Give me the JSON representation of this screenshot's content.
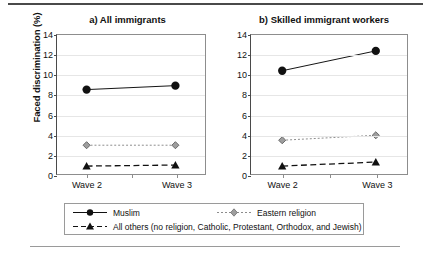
{
  "chart_data": {
    "type": "line",
    "title": "",
    "ylabel": "Faced discrimination (%)",
    "xlabel": "",
    "categories": [
      "Wave 2",
      "Wave 3"
    ],
    "ylim": [
      0,
      14
    ],
    "yticks": [
      0,
      2,
      4,
      6,
      8,
      10,
      12,
      14
    ],
    "grid": true,
    "legend_position": "bottom",
    "panels": [
      {
        "label": "a)",
        "title": "a)  All immigrants",
        "series": [
          {
            "name": "Muslim",
            "values": [
              8.5,
              8.9
            ],
            "marker": "circle",
            "line": "solid",
            "color": "#111111"
          },
          {
            "name": "Eastern religion",
            "values": [
              2.9,
              2.9
            ],
            "marker": "diamond",
            "line": "dotted",
            "color": "#8c8c8c"
          },
          {
            "name": "All others (no religion, Catholic, Protestant, Orthodox, and Jewish)",
            "values": [
              0.8,
              0.9
            ],
            "marker": "triangle",
            "line": "dashed",
            "color": "#111111"
          }
        ]
      },
      {
        "label": "b)",
        "title": "b)  Skilled immigrant workers",
        "series": [
          {
            "name": "Muslim",
            "values": [
              10.4,
              12.4
            ],
            "marker": "circle",
            "line": "solid",
            "color": "#111111"
          },
          {
            "name": "Eastern religion",
            "values": [
              3.4,
              3.9
            ],
            "marker": "diamond",
            "line": "dotted",
            "color": "#8c8c8c"
          },
          {
            "name": "All others (no religion, Catholic, Protestant, Orthodox, and Jewish)",
            "values": [
              0.8,
              1.2
            ],
            "marker": "triangle",
            "line": "dashed",
            "color": "#111111"
          }
        ]
      }
    ],
    "legend": [
      {
        "label": "Muslim",
        "marker": "circle",
        "line": "solid",
        "color": "#111111"
      },
      {
        "label": "Eastern religion",
        "marker": "diamond",
        "line": "dotted",
        "color": "#8c8c8c"
      },
      {
        "label": "All others (no religion, Catholic, Protestant, Orthodox, and Jewish)",
        "marker": "triangle",
        "line": "dashed",
        "color": "#111111"
      }
    ]
  },
  "colors": {
    "muslim": "#111111",
    "eastern": "#8c8c8c",
    "all_others": "#111111",
    "grid": "#e6e6e6",
    "axis": "#4a4a4a",
    "frame": "#8d8d8d"
  }
}
